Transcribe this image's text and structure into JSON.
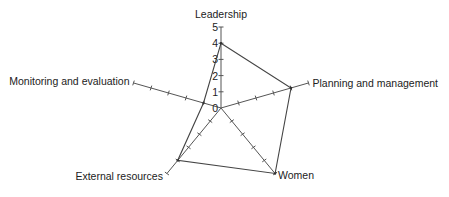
{
  "chart_data": {
    "type": "radar",
    "title": "",
    "categories": [
      "Leadership",
      "Planning and management",
      "Women",
      "External resources",
      "Monitoring and evaluation"
    ],
    "series": [
      {
        "name": "Score",
        "values": [
          4,
          4,
          5,
          4,
          1
        ]
      }
    ],
    "rlim": [
      0,
      5
    ],
    "rticks": [
      "0",
      "1",
      "2",
      "3",
      "4",
      "5"
    ],
    "grid": false,
    "legend": "none"
  }
}
